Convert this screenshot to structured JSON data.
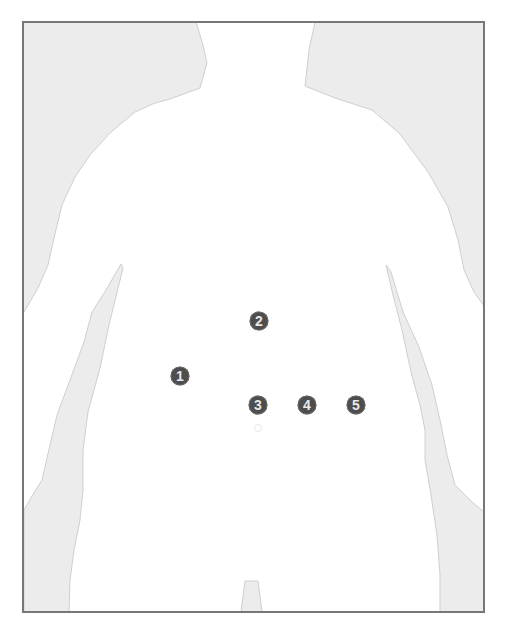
{
  "figure": {
    "colors": {
      "border": "#777777",
      "background_fill": "#ececec",
      "body_fill": "#ffffff",
      "marker_fill": "#4d4d4d",
      "marker_text": "#e8e8e8"
    }
  },
  "markers": [
    {
      "label": "1",
      "x": 180,
      "y": 376
    },
    {
      "label": "2",
      "x": 259,
      "y": 321
    },
    {
      "label": "3",
      "x": 258,
      "y": 405
    },
    {
      "label": "4",
      "x": 307,
      "y": 405
    },
    {
      "label": "5",
      "x": 356,
      "y": 405
    }
  ],
  "navel": {
    "x": 258,
    "y": 428
  }
}
